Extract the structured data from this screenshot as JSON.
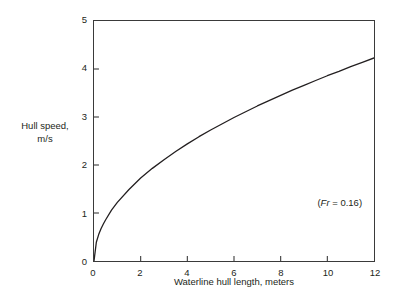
{
  "chart_data": {
    "type": "line",
    "title": "",
    "xlabel": "Waterline hull length, meters",
    "ylabel_line1": "Hull speed,",
    "ylabel_line2": "m/s",
    "xlim": [
      0,
      12
    ],
    "ylim": [
      0,
      5
    ],
    "xticks": [
      0,
      2,
      4,
      6,
      8,
      10,
      12
    ],
    "yticks": [
      0,
      1,
      2,
      3,
      4,
      5
    ],
    "xtick_labels": [
      "0",
      "2",
      "4",
      "6",
      "8",
      "10",
      "12"
    ],
    "ytick_labels": [
      "0",
      "1",
      "2",
      "3",
      "4",
      "5"
    ],
    "grid": false,
    "legend": false,
    "line_color": "#231f20",
    "series": [
      {
        "name": "Hull speed",
        "relationship": "v = 1.22 * sqrt(L)",
        "x": [
          0,
          0.1,
          0.2,
          0.3,
          0.4,
          0.5,
          0.75,
          1,
          1.5,
          2,
          2.5,
          3,
          3.5,
          4,
          4.5,
          5,
          5.5,
          6,
          6.5,
          7,
          7.5,
          8,
          8.5,
          9,
          9.5,
          10,
          10.5,
          11,
          11.5,
          12
        ],
        "y": [
          0,
          0.39,
          0.55,
          0.67,
          0.77,
          0.86,
          1.06,
          1.22,
          1.49,
          1.73,
          1.93,
          2.11,
          2.28,
          2.44,
          2.59,
          2.73,
          2.86,
          2.99,
          3.11,
          3.23,
          3.34,
          3.45,
          3.56,
          3.66,
          3.76,
          3.86,
          3.95,
          4.05,
          4.14,
          4.23
        ]
      }
    ],
    "annotations": [
      {
        "name": "froude-number",
        "prefix": "(",
        "symbol": "Fr",
        "suffix": " = 0.16)",
        "x": 10.5,
        "y": 1.25
      }
    ]
  }
}
